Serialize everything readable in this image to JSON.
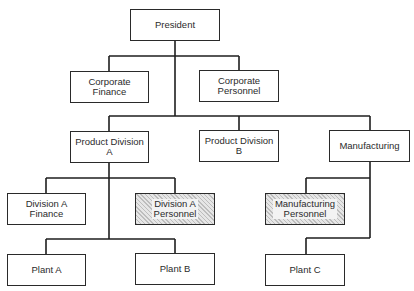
{
  "diagram": {
    "type": "org-chart",
    "nodes": {
      "president": {
        "label": "President"
      },
      "corporate_finance": {
        "label": "Corporate\nFinance"
      },
      "corporate_personnel": {
        "label": "Corporate\nPersonnel"
      },
      "product_division_a": {
        "label": "Product Division\nA"
      },
      "product_division_b": {
        "label": "Product Division\nB"
      },
      "manufacturing": {
        "label": "Manufacturing"
      },
      "division_a_finance": {
        "label": "Division A\nFinance"
      },
      "division_a_personnel": {
        "label": "Division A\nPersonnel",
        "shaded": true
      },
      "manufacturing_personnel": {
        "label": "Manufacturing\nPersonnel",
        "shaded": true
      },
      "plant_a": {
        "label": "Plant A"
      },
      "plant_b": {
        "label": "Plant B"
      },
      "plant_c": {
        "label": "Plant C"
      }
    },
    "edges": [
      [
        "President",
        "Corporate Finance"
      ],
      [
        "President",
        "Corporate Personnel"
      ],
      [
        "President",
        "Product Division A"
      ],
      [
        "President",
        "Product Division B"
      ],
      [
        "President",
        "Manufacturing"
      ],
      [
        "Product Division A",
        "Division A Finance"
      ],
      [
        "Product Division A",
        "Division A Personnel"
      ],
      [
        "Product Division A",
        "Plant A"
      ],
      [
        "Product Division A",
        "Plant B"
      ],
      [
        "Manufacturing",
        "Manufacturing Personnel"
      ],
      [
        "Manufacturing",
        "Plant C"
      ]
    ],
    "colors": {
      "line": "#1e1e1e",
      "box_border": "#2a2a2a",
      "shaded_fill": "#d9d9d9",
      "text": "#2b2b2b"
    }
  }
}
